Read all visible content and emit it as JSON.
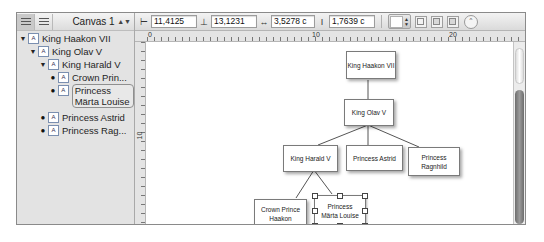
{
  "sidebar": {
    "view_buttons": [
      "hierarchy-view",
      "list-view"
    ],
    "canvas_select": "Canvas 1",
    "tree": [
      {
        "label": "King Haakon VII",
        "level": 0,
        "expander": "▼"
      },
      {
        "label": "King Olav V",
        "level": 1,
        "expander": "▼"
      },
      {
        "label": "King Harald V",
        "level": 2,
        "expander": "▼"
      },
      {
        "label": "Crown Prin...",
        "level": 3,
        "expander": "•"
      },
      {
        "label": "Princess Märta Louise",
        "level": 3,
        "expander": "•",
        "selected": true
      },
      {
        "label": "Princess Astrid",
        "level": 2,
        "expander": "•"
      },
      {
        "label": "Princess Rag...",
        "level": 2,
        "expander": "•"
      }
    ]
  },
  "toolbar": {
    "x": "11,4125",
    "y": "13,1231",
    "width": "3,5278 c",
    "height": "1,7639 c"
  },
  "rulers": {
    "h_labels": [
      "0",
      "10",
      "20"
    ],
    "v_labels": [
      "10"
    ]
  },
  "diagram": {
    "nodes": [
      {
        "id": "haakon",
        "label": "King Haakon VII"
      },
      {
        "id": "olav",
        "label": "King Olav V"
      },
      {
        "id": "harald",
        "label": "King Harald V"
      },
      {
        "id": "astrid",
        "label": "Princess Astrid"
      },
      {
        "id": "ragnhild",
        "label": "Princess Ragnhild"
      },
      {
        "id": "haakon_cp",
        "label": "Crown Prince Haakon"
      },
      {
        "id": "marta",
        "label": "Princess Märta Louise",
        "selected": true
      }
    ]
  }
}
